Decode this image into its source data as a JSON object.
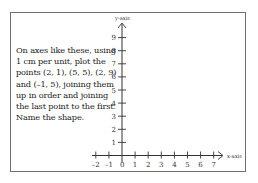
{
  "instructions": {
    "lines": [
      "On axes like these, using",
      "1 cm per unit, plot the",
      "points (2, 1), (5, 5), (2, 9)",
      "and (–1, 5), joining them",
      "up in order and joining",
      "the last point to the first.",
      "Name the shape."
    ]
  },
  "axes": {
    "x_label": "x-axis",
    "y_label": "y-axis",
    "x_ticks": [
      "–2",
      "–1",
      "0",
      "1",
      "2",
      "3",
      "4",
      "5",
      "6",
      "7"
    ],
    "y_ticks": [
      "1",
      "2",
      "3",
      "4",
      "5",
      "6",
      "7",
      "8",
      "9"
    ],
    "x_range": [
      -2,
      7
    ],
    "y_range": [
      0,
      9
    ],
    "unit": "1 cm per unit"
  },
  "points": [
    {
      "x": 2,
      "y": 1
    },
    {
      "x": 5,
      "y": 5
    },
    {
      "x": 2,
      "y": 9
    },
    {
      "x": -1,
      "y": 5
    }
  ],
  "colors": {
    "frame": "#6e6e6e",
    "axis": "#333333",
    "text": "#222222"
  }
}
